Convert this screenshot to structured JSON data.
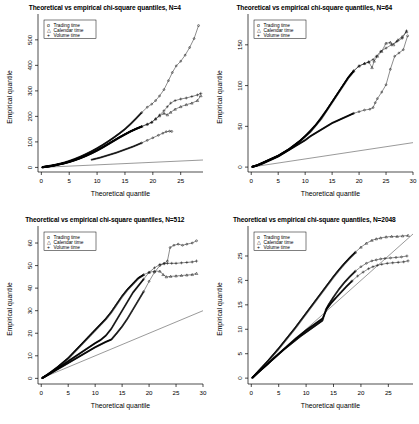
{
  "figure": {
    "name": "chi-square-qq-panels",
    "panel_count": 4,
    "background": "#ffffff",
    "foreground": "#000000"
  },
  "legend": {
    "entries": [
      {
        "symbol": "o",
        "label": "Trading time"
      },
      {
        "symbol": "△",
        "label": "Calendar time"
      },
      {
        "symbol": "+",
        "label": "Volume time"
      }
    ]
  },
  "panels": [
    {
      "id": "panel-n4",
      "title": "Theoretical vs empirical chi-square quantiles, N=4",
      "xlabel": "Theoretical quantile",
      "ylabel": "Empirical quantile"
    },
    {
      "id": "panel-n64",
      "title": "Theoretical vs empirical chi-square quantiles, N=64",
      "xlabel": "Theoretical quantile",
      "ylabel": "Empirical quantile"
    },
    {
      "id": "panel-n512",
      "title": "Theoretical vs empirical chi-square quantiles, N=512",
      "xlabel": "Theoretical quantile",
      "ylabel": "Empirical quantile"
    },
    {
      "id": "panel-n2048",
      "title": "Theoretical vs empirical chi-square quantiles, N=2048",
      "xlabel": "Theoretical quantile",
      "ylabel": "Empirical quantile"
    }
  ],
  "chart_data": [
    {
      "type": "scatter",
      "title": "Theoretical vs empirical chi-square quantiles, N=4",
      "xlabel": "Theoretical quantile",
      "ylabel": "Empirical quantile",
      "xlim": [
        -0.6,
        29.0
      ],
      "ylim": [
        -18,
        570
      ],
      "xticks": [
        0,
        5,
        10,
        15,
        20,
        25
      ],
      "yticks": [
        0,
        100,
        200,
        300,
        400,
        500
      ],
      "grid": false,
      "legend_position": "top-left",
      "reference_line": {
        "from": [
          0,
          0
        ],
        "to": [
          29,
          29
        ]
      },
      "series": [
        {
          "name": "Trading time",
          "symbol": "o",
          "x": [
            0.2,
            0.8,
            1.5,
            2.3,
            3.1,
            4.0,
            5.0,
            6.0,
            7.0,
            8.0,
            9.0,
            10.0,
            11.0,
            12.0,
            13.0,
            14.0,
            15.0,
            16.0,
            17.0,
            18.0,
            19.0,
            19.8,
            20.5,
            21.2,
            22.0,
            22.8,
            23.5,
            24.2,
            25.0,
            25.8,
            26.6,
            27.4,
            28.2
          ],
          "y": [
            1,
            3,
            6,
            9,
            13,
            18,
            25,
            33,
            42,
            52,
            63,
            75,
            88,
            102,
            117,
            133,
            150,
            170,
            192,
            215,
            236,
            248,
            262,
            280,
            305,
            340,
            372,
            398,
            416,
            440,
            470,
            505,
            556
          ]
        },
        {
          "name": "Calendar time",
          "symbol": "△",
          "x": [
            0.2,
            0.8,
            1.5,
            2.3,
            3.1,
            4.0,
            5.0,
            6.0,
            7.0,
            8.0,
            9.0,
            10.0,
            11.0,
            12.0,
            13.0,
            14.0,
            15.0,
            16.0,
            17.0,
            18.0,
            19.0,
            19.8,
            20.5,
            21.2,
            22.0,
            22.6,
            23.2,
            24.0,
            25.0,
            26.0,
            27.0,
            28.0,
            28.6
          ],
          "y": [
            1,
            3,
            5,
            8,
            12,
            16,
            22,
            29,
            37,
            46,
            56,
            67,
            79,
            92,
            105,
            118,
            130,
            142,
            152,
            161,
            170,
            178,
            190,
            202,
            212,
            206,
            216,
            228,
            238,
            246,
            252,
            262,
            281
          ]
        },
        {
          "name": "Volume time",
          "symbol": "+",
          "x": [
            0.2,
            0.8,
            1.5,
            2.3,
            3.1,
            4.0,
            5.0,
            6.0,
            7.0,
            8.0,
            9.0,
            10.0,
            11.0,
            12.0,
            13.0,
            14.0,
            15.0,
            16.0,
            17.0,
            18.0,
            19.0,
            19.8,
            20.5,
            21.2,
            22.0,
            22.6,
            23.2,
            24.0,
            25.0,
            26.0,
            27.0,
            28.0,
            28.6
          ],
          "y": [
            1,
            3,
            5,
            8,
            12,
            16,
            22,
            29,
            37,
            46,
            56,
            67,
            79,
            92,
            105,
            118,
            130,
            141,
            151,
            160,
            168,
            176,
            190,
            205,
            222,
            238,
            252,
            262,
            268,
            272,
            278,
            284,
            290
          ]
        },
        {
          "name": "Trading time lower branch",
          "symbol": "o",
          "x": [
            9.0,
            10.5,
            12.0,
            13.5,
            15.0,
            16.5,
            18.0,
            19.0,
            20.0,
            21.0,
            21.8,
            22.4,
            23.0,
            23.4
          ],
          "y": [
            30,
            38,
            48,
            58,
            70,
            82,
            96,
            106,
            116,
            126,
            134,
            140,
            142,
            141
          ]
        }
      ]
    },
    {
      "type": "scatter",
      "title": "Theoretical vs empirical chi-square quantiles, N=64",
      "xlabel": "Theoretical quantile",
      "ylabel": "Empirical quantile",
      "xlim": [
        -0.6,
        30.0
      ],
      "ylim": [
        -6,
        178
      ],
      "xticks": [
        0,
        5,
        10,
        15,
        20,
        25,
        30
      ],
      "yticks": [
        0,
        50,
        100,
        150
      ],
      "grid": false,
      "legend_position": "top-left",
      "reference_line": {
        "from": [
          0,
          0
        ],
        "to": [
          30,
          30
        ]
      },
      "series": [
        {
          "name": "Trading time",
          "symbol": "o",
          "x": [
            0.2,
            1.0,
            2.0,
            3.0,
            4.0,
            5.0,
            6.0,
            7.0,
            8.0,
            9.0,
            10.0,
            11.0,
            12.0,
            13.0,
            14.0,
            15.0,
            16.0,
            17.0,
            18.0,
            19.0,
            20.0,
            21.0,
            22.0,
            22.6,
            23.0,
            23.4,
            24.2,
            25.0,
            25.8,
            26.6,
            27.4,
            28.2,
            29.0
          ],
          "y": [
            0.5,
            2,
            4,
            7,
            10,
            13,
            17,
            21,
            25,
            29,
            33,
            38,
            42,
            46,
            50,
            54,
            57,
            60,
            63,
            66,
            68,
            70,
            71,
            73,
            79,
            84,
            92,
            101,
            120,
            136,
            140,
            144,
            161
          ]
        },
        {
          "name": "Calendar time",
          "symbol": "△",
          "x": [
            0.2,
            1.0,
            2.0,
            3.0,
            4.0,
            5.0,
            6.0,
            7.0,
            8.0,
            9.0,
            10.0,
            11.0,
            12.0,
            13.0,
            14.0,
            15.0,
            16.0,
            17.0,
            18.0,
            19.0,
            20.0,
            21.0,
            21.8,
            22.4,
            22.8,
            23.4,
            24.2,
            25.0,
            25.8,
            26.4,
            27.2,
            28.0,
            28.8
          ],
          "y": [
            0.5,
            2,
            5,
            8,
            11,
            14,
            18,
            22,
            27,
            32,
            38,
            44,
            52,
            60,
            70,
            80,
            90,
            100,
            110,
            118,
            124,
            127,
            129,
            122,
            130,
            136,
            142,
            152,
            153,
            150,
            156,
            160,
            166
          ]
        },
        {
          "name": "Volume time",
          "symbol": "+",
          "x": [
            0.2,
            1.0,
            2.0,
            3.0,
            4.0,
            5.0,
            6.0,
            7.0,
            8.0,
            9.0,
            10.0,
            11.0,
            12.0,
            13.0,
            14.0,
            15.0,
            16.0,
            17.0,
            18.0,
            19.0,
            20.0,
            21.0,
            21.8,
            22.6,
            23.2,
            24.0,
            25.0,
            26.0,
            27.0,
            28.0,
            28.8
          ],
          "y": [
            0.5,
            2,
            5,
            8,
            11,
            14,
            18,
            22,
            27,
            32,
            38,
            45,
            52,
            61,
            70,
            80,
            90,
            100,
            110,
            118,
            124,
            127,
            129,
            132,
            136,
            142,
            146,
            150,
            154,
            158,
            167
          ]
        }
      ]
    },
    {
      "type": "scatter",
      "title": "Theoretical vs empirical chi-square quantiles, N=512",
      "xlabel": "Theoretical quantile",
      "ylabel": "Empirical quantile",
      "xlim": [
        -0.6,
        30.0
      ],
      "ylim": [
        -2.5,
        64
      ],
      "xticks": [
        0,
        5,
        10,
        15,
        20,
        25,
        30
      ],
      "yticks": [
        0,
        10,
        20,
        30,
        40,
        50,
        60
      ],
      "grid": false,
      "legend_position": "top-left",
      "reference_line": {
        "from": [
          0,
          0
        ],
        "to": [
          30,
          30
        ]
      },
      "series": [
        {
          "name": "Trading time",
          "symbol": "o",
          "x": [
            0.2,
            1.0,
            2.0,
            3.0,
            4.0,
            5.0,
            6.0,
            7.0,
            8.0,
            9.0,
            10.0,
            11.0,
            12.0,
            13.0,
            14.0,
            15.0,
            16.0,
            17.0,
            18.0,
            19.0,
            20.0,
            21.0,
            22.0,
            22.8,
            23.4,
            23.9,
            24.6,
            25.4,
            26.2,
            27.0,
            28.0,
            28.8
          ],
          "y": [
            0.2,
            1.2,
            2.6,
            4.0,
            5.4,
            6.8,
            8.2,
            9.6,
            11.0,
            12.4,
            13.8,
            15.0,
            16.2,
            17.2,
            20.0,
            23.0,
            26.5,
            30.5,
            34.5,
            38.5,
            43.0,
            47.0,
            50.0,
            51.0,
            52.0,
            58.0,
            59.0,
            59.5,
            59.0,
            59.5,
            60.0,
            61.0
          ]
        },
        {
          "name": "Calendar time",
          "symbol": "△",
          "x": [
            0.2,
            1.0,
            2.0,
            3.0,
            4.0,
            5.0,
            6.0,
            7.0,
            8.0,
            9.0,
            10.0,
            11.0,
            12.0,
            13.0,
            14.0,
            15.0,
            16.0,
            17.0,
            18.0,
            19.0,
            20.0,
            21.0,
            22.0,
            22.6,
            23.2,
            24.0,
            25.0,
            26.0,
            27.0,
            28.0,
            28.8
          ],
          "y": [
            0.2,
            1.5,
            3.2,
            5.0,
            7.0,
            9.0,
            11.5,
            14.0,
            16.5,
            19.0,
            21.5,
            24.0,
            26.5,
            29.5,
            33.0,
            36.5,
            39.5,
            42.0,
            44.5,
            46.0,
            47.0,
            47.5,
            47.5,
            46.0,
            45.0,
            45.2,
            45.4,
            45.6,
            45.8,
            46.0,
            46.5
          ]
        },
        {
          "name": "Volume time",
          "symbol": "+",
          "x": [
            0.2,
            1.0,
            2.0,
            3.0,
            4.0,
            5.0,
            6.0,
            7.0,
            8.0,
            9.0,
            10.0,
            11.0,
            12.0,
            13.0,
            14.0,
            15.0,
            16.0,
            17.0,
            18.0,
            19.0,
            20.0,
            21.0,
            22.0,
            22.8,
            23.4,
            24.2,
            25.0,
            26.0,
            27.0,
            28.0,
            28.8
          ],
          "y": [
            0.2,
            1.3,
            2.8,
            4.4,
            6.0,
            7.6,
            9.2,
            10.8,
            12.4,
            14.0,
            15.6,
            17.0,
            19.0,
            22.0,
            26.0,
            30.0,
            34.0,
            38.0,
            41.0,
            44.0,
            47.0,
            49.0,
            50.5,
            50.8,
            51.0,
            51.0,
            51.0,
            51.2,
            51.4,
            51.6,
            52.0
          ]
        }
      ]
    },
    {
      "type": "scatter",
      "title": "Theoretical vs empirical chi-square quantiles, N=2048",
      "xlabel": "Theoretical quantile",
      "ylabel": "Empirical quantile",
      "xlim": [
        -0.6,
        29.5
      ],
      "ylim": [
        -1.2,
        29.5
      ],
      "xticks": [
        0,
        5,
        10,
        15,
        20,
        25
      ],
      "yticks": [
        0,
        5,
        10,
        15,
        20,
        25
      ],
      "grid": false,
      "legend_position": "top-left",
      "reference_line": {
        "from": [
          0,
          0
        ],
        "to": [
          29.5,
          29.5
        ]
      },
      "series": [
        {
          "name": "Trading time",
          "symbol": "o",
          "x": [
            0.2,
            1.0,
            2.0,
            3.0,
            4.0,
            5.0,
            6.0,
            7.0,
            8.0,
            9.0,
            10.0,
            11.0,
            12.0,
            13.0,
            13.6,
            14.2,
            15.0,
            16.0,
            17.0,
            18.0,
            19.0,
            20.0,
            21.0,
            22.0,
            22.8,
            23.6,
            24.4,
            25.4,
            26.4,
            27.4,
            28.4
          ],
          "y": [
            0.1,
            0.9,
            1.9,
            2.9,
            3.9,
            4.9,
            5.9,
            6.8,
            7.7,
            8.6,
            9.4,
            10.2,
            11.0,
            11.8,
            14.0,
            15.2,
            16.6,
            18.2,
            19.6,
            20.8,
            21.9,
            22.8,
            23.5,
            24.0,
            24.2,
            24.4,
            24.5,
            24.6,
            24.7,
            24.8,
            25.0
          ]
        },
        {
          "name": "Calendar time",
          "symbol": "△",
          "x": [
            0.2,
            1.0,
            2.0,
            3.0,
            4.0,
            5.0,
            6.0,
            7.0,
            8.0,
            9.0,
            10.0,
            11.0,
            12.0,
            13.0,
            14.0,
            15.0,
            16.0,
            17.0,
            18.0,
            19.0,
            20.0,
            21.0,
            22.0,
            22.8,
            23.6,
            24.6,
            25.6,
            26.6,
            27.6,
            28.6
          ],
          "y": [
            0.1,
            1.1,
            2.3,
            3.5,
            4.8,
            6.1,
            7.5,
            8.9,
            10.3,
            11.8,
            13.3,
            14.8,
            16.3,
            17.8,
            19.3,
            20.8,
            22.2,
            23.5,
            24.7,
            25.8,
            26.8,
            27.6,
            28.2,
            28.5,
            28.7,
            28.9,
            29.0,
            29.0,
            29.1,
            29.2
          ]
        },
        {
          "name": "Volume time",
          "symbol": "+",
          "x": [
            0.2,
            1.0,
            2.0,
            3.0,
            4.0,
            5.0,
            6.0,
            7.0,
            8.0,
            9.0,
            10.0,
            11.0,
            12.0,
            13.0,
            13.8,
            14.6,
            15.4,
            16.4,
            17.4,
            18.4,
            19.4,
            20.4,
            21.4,
            22.2,
            23.0,
            23.8,
            24.8,
            25.8,
            26.8,
            27.8,
            28.6
          ],
          "y": [
            0.1,
            0.9,
            1.9,
            2.9,
            4.0,
            5.0,
            6.0,
            7.0,
            8.0,
            8.9,
            9.8,
            10.6,
            11.4,
            12.2,
            14.2,
            15.4,
            16.4,
            17.6,
            18.8,
            19.9,
            20.9,
            21.7,
            22.4,
            22.8,
            23.1,
            23.3,
            23.5,
            23.6,
            23.7,
            23.8,
            24.0
          ]
        }
      ]
    }
  ]
}
